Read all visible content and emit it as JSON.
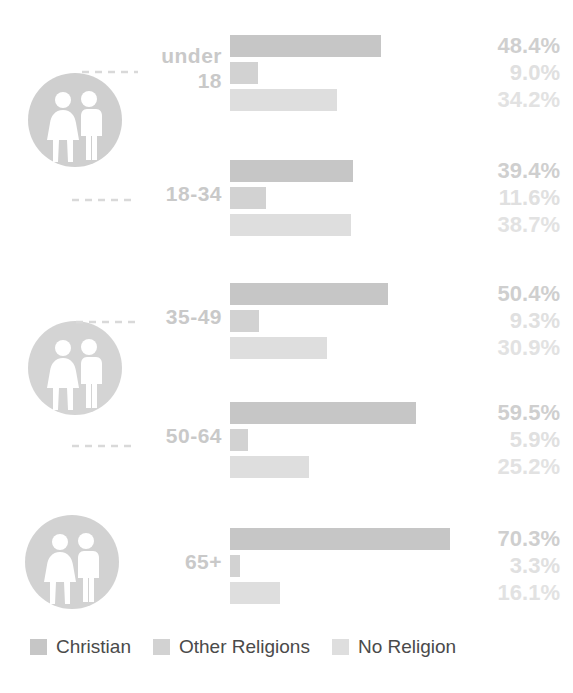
{
  "chart_data": {
    "type": "bar",
    "title": "",
    "subtitle": "",
    "xlabel": "",
    "ylabel": "",
    "orientation": "horizontal",
    "grid": false,
    "legend_position": "bottom",
    "xlim": [
      0,
      100
    ],
    "value_suffix": "%",
    "px_per_percent": 3.13,
    "categories": [
      "under\n18",
      "18-34",
      "35-49",
      "50-64",
      "65+"
    ],
    "series": [
      {
        "name": "Christian",
        "color": "#c6c6c6",
        "values": [
          48.4,
          39.4,
          50.4,
          59.5,
          70.3
        ]
      },
      {
        "name": "Other Religions",
        "color": "#d2d2d2",
        "values": [
          9.0,
          11.6,
          9.3,
          5.9,
          3.3
        ]
      },
      {
        "name": "No Religion",
        "color": "#dedede",
        "values": [
          34.2,
          38.7,
          30.9,
          25.2,
          16.1
        ]
      }
    ],
    "value_label_colors": [
      "#c2c2c2",
      "#cfcfcf",
      "#e0e0e0"
    ],
    "rows": [
      {
        "label": "under\n18",
        "values": [
          "48.4%",
          "9.0%",
          "34.2%"
        ],
        "numbers": [
          48.4,
          9.0,
          34.2
        ]
      },
      {
        "label": "18-34",
        "values": [
          "39.4%",
          "11.6%",
          "38.7%"
        ],
        "numbers": [
          39.4,
          11.6,
          38.7
        ]
      },
      {
        "label": "35-49",
        "values": [
          "50.4%",
          "9.3%",
          "30.9%"
        ],
        "numbers": [
          50.4,
          9.3,
          30.9
        ]
      },
      {
        "label": "50-64",
        "values": [
          "59.5%",
          "5.9%",
          "25.2%"
        ],
        "numbers": [
          59.5,
          5.9,
          25.2
        ]
      },
      {
        "label": "65+",
        "values": [
          "70.3%",
          "3.3%",
          "16.1%"
        ],
        "numbers": [
          70.3,
          3.3,
          16.1
        ]
      }
    ]
  },
  "legend": {
    "items": [
      {
        "label": "Christian",
        "color": "#c6c6c6",
        "icon": "square-swatch-icon"
      },
      {
        "label": "Other Religions",
        "color": "#d2d2d2",
        "icon": "square-swatch-icon"
      },
      {
        "label": "No Religion",
        "color": "#dedede",
        "icon": "square-swatch-icon"
      }
    ]
  },
  "icons": {
    "people_badge": "people-pair-icon",
    "connector": "dashed-connector-icon"
  },
  "colors": {
    "background": "#ffffff",
    "badge_circle": "#cfcfcf",
    "badge_figures": "#ffffff",
    "row_label": "#c9c9c9",
    "legend_text": "#4a4a4a",
    "connector": "#d8d8d8"
  },
  "layout": {
    "bar_origin_x": 230,
    "bar_height": 22,
    "bar_gap": 5,
    "row_tops": [
      35,
      160,
      283,
      402,
      528
    ],
    "badges": [
      {
        "cx": 75,
        "cy": 120
      },
      {
        "cx": 75,
        "cy": 368
      },
      {
        "cx": 72,
        "cy": 562
      }
    ],
    "connectors": [
      {
        "x": 85,
        "y": 72,
        "w": 55,
        "dir": "down-right"
      },
      {
        "x": 78,
        "y": 198,
        "w": 55,
        "dir": "up-right"
      },
      {
        "x": 80,
        "y": 320,
        "w": 55,
        "dir": "down-right"
      },
      {
        "x": 78,
        "y": 444,
        "w": 55,
        "dir": "up-right"
      }
    ]
  }
}
